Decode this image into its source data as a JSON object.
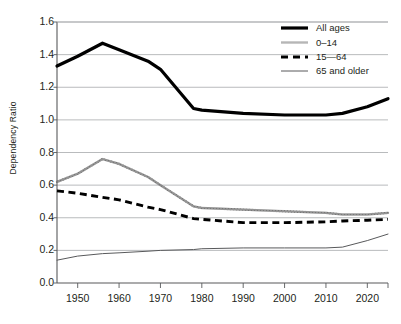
{
  "chart_data": {
    "type": "line",
    "title": "",
    "xlabel": "",
    "ylabel": "Dependency Ratio",
    "xlim": [
      1945,
      2025
    ],
    "ylim": [
      0.0,
      1.6
    ],
    "grid": true,
    "legend_position": "top-right",
    "y_ticks": [
      "1.6",
      "1.4",
      "1.2",
      "1.0",
      "0.8",
      "0.6",
      "0.4",
      "0.2",
      "0.0"
    ],
    "y_tick_values": [
      1.6,
      1.4,
      1.2,
      1.0,
      0.8,
      0.6,
      0.4,
      0.2,
      0.0
    ],
    "x_ticks": [
      "1950",
      "1960",
      "1970",
      "1980",
      "1990",
      "2000",
      "2010",
      "2020"
    ],
    "x_tick_values": [
      1950,
      1960,
      1970,
      1980,
      1990,
      2000,
      2010,
      2020
    ],
    "x": [
      1945,
      1950,
      1956,
      1960,
      1967,
      1970,
      1978,
      1980,
      1990,
      2000,
      2010,
      2014,
      2020,
      2025
    ],
    "series": [
      {
        "name": "All ages",
        "style": "thick-solid-black",
        "color": "#000000",
        "values": [
          1.33,
          1.39,
          1.47,
          1.43,
          1.36,
          1.31,
          1.07,
          1.06,
          1.04,
          1.03,
          1.03,
          1.04,
          1.08,
          1.13
        ]
      },
      {
        "name": "0–14",
        "style": "textured-gray",
        "color": "#6f6f6f",
        "values": [
          0.62,
          0.67,
          0.76,
          0.73,
          0.65,
          0.6,
          0.47,
          0.46,
          0.45,
          0.44,
          0.43,
          0.42,
          0.42,
          0.43
        ]
      },
      {
        "name": "15—64",
        "style": "dashed-black",
        "color": "#000000",
        "values": [
          0.565,
          0.55,
          0.525,
          0.51,
          0.465,
          0.45,
          0.395,
          0.39,
          0.37,
          0.37,
          0.375,
          0.38,
          0.385,
          0.39
        ]
      },
      {
        "name": "65 and older",
        "style": "thin-solid-gray",
        "color": "#58595b",
        "values": [
          0.14,
          0.165,
          0.18,
          0.185,
          0.195,
          0.2,
          0.205,
          0.21,
          0.215,
          0.215,
          0.215,
          0.22,
          0.26,
          0.3
        ]
      }
    ],
    "legend": [
      {
        "label": "All ages",
        "swatch": "thick-solid-black"
      },
      {
        "label": "0–14",
        "swatch": "textured-gray"
      },
      {
        "label": "15—64",
        "swatch": "dashed-black"
      },
      {
        "label": "65 and older",
        "swatch": "thin-solid-gray"
      }
    ]
  },
  "colors": {
    "axis": "#58595b",
    "grid": "#a7a9ac",
    "text": "#231f20",
    "series_black": "#000000",
    "series_gray": "#6f6f6f",
    "series_thin_gray": "#58595b"
  }
}
